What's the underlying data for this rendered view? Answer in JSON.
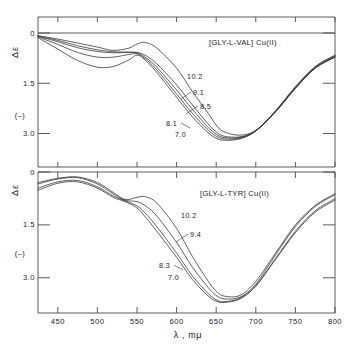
{
  "figure": {
    "xaxis_title": "λ , mμ",
    "x_ticks": [
      "450",
      "500",
      "550",
      "600",
      "650",
      "700",
      "750",
      "800"
    ],
    "x_tick_values": [
      450,
      500,
      550,
      600,
      650,
      700,
      750,
      800
    ],
    "xlim": [
      425,
      800
    ],
    "y_ticks": [
      "0",
      "1.5",
      "3.0"
    ],
    "y_tick_values": [
      0,
      1.5,
      3.0
    ],
    "y_axis_symbol": "Δε",
    "y_negative_marker": "(–)",
    "ylim": [
      0,
      4.0
    ],
    "ink_color": "#2b2b2b",
    "axis_color": "#4a4a4a"
  },
  "panels": [
    {
      "id": "upper",
      "title": "[GLY-L-VAL] Cu(II)",
      "curve_labels": [
        "10.2",
        "9.1",
        "8.5",
        "8.1",
        "7.0"
      ]
    },
    {
      "id": "lower",
      "title": "[GLY-L-TYR] Cu(II)",
      "curve_labels": [
        "10.2",
        "9.4",
        "8.3",
        "7.0"
      ]
    }
  ],
  "chart_data": {
    "type": "line",
    "xlabel": "λ , mμ",
    "ylabel": "Δε (–)",
    "xlim": [
      425,
      800
    ],
    "ylim": [
      0,
      4.0
    ],
    "y_inverted": true,
    "grid": false,
    "legend": "inline curve labels (pH values)",
    "subplots": [
      {
        "name": "[GLY-L-VAL] Cu(II)",
        "legend_title": "pH",
        "series": [
          {
            "name": "10.2",
            "x": [
              425,
              450,
              475,
              500,
              520,
              540,
              550,
              560,
              575,
              600,
              620,
              640,
              650,
              660,
              680,
              700,
              725,
              750,
              775,
              800
            ],
            "y": [
              0.08,
              0.18,
              0.3,
              0.42,
              0.52,
              0.45,
              0.33,
              0.28,
              0.45,
              1.05,
              1.75,
              2.4,
              2.75,
              2.95,
              3.05,
              2.9,
              2.35,
              1.65,
              1.05,
              0.72
            ]
          },
          {
            "name": "9.1",
            "x": [
              425,
              450,
              475,
              500,
              520,
              540,
              550,
              560,
              575,
              600,
              620,
              640,
              650,
              660,
              680,
              700,
              725,
              750,
              775,
              800
            ],
            "y": [
              0.09,
              0.22,
              0.38,
              0.5,
              0.56,
              0.57,
              0.58,
              0.66,
              0.92,
              1.55,
              2.15,
              2.72,
              2.95,
              3.08,
              3.1,
              2.92,
              2.35,
              1.65,
              1.05,
              0.72
            ]
          },
          {
            "name": "8.5",
            "x": [
              425,
              450,
              475,
              500,
              520,
              540,
              550,
              560,
              575,
              600,
              620,
              640,
              650,
              660,
              680,
              700,
              725,
              750,
              775,
              800
            ],
            "y": [
              0.1,
              0.26,
              0.44,
              0.55,
              0.59,
              0.58,
              0.6,
              0.72,
              1.02,
              1.7,
              2.28,
              2.82,
              3.02,
              3.12,
              3.12,
              2.92,
              2.34,
              1.64,
              1.04,
              0.7
            ]
          },
          {
            "name": "8.1",
            "x": [
              425,
              450,
              475,
              500,
              520,
              540,
              550,
              560,
              575,
              600,
              620,
              640,
              650,
              660,
              680,
              700,
              725,
              750,
              775,
              800
            ],
            "y": [
              0.12,
              0.34,
              0.58,
              0.72,
              0.72,
              0.64,
              0.62,
              0.76,
              1.1,
              1.82,
              2.4,
              2.9,
              3.08,
              3.16,
              3.14,
              2.92,
              2.33,
              1.62,
              1.02,
              0.68
            ]
          },
          {
            "name": "7.0",
            "x": [
              425,
              450,
              475,
              500,
              520,
              540,
              550,
              560,
              575,
              600,
              620,
              640,
              650,
              660,
              680,
              700,
              725,
              750,
              775,
              800
            ],
            "y": [
              0.14,
              0.48,
              0.82,
              1.02,
              1.0,
              0.8,
              0.66,
              0.8,
              1.18,
              1.92,
              2.5,
              2.98,
              3.14,
              3.2,
              3.16,
              2.92,
              2.32,
              1.6,
              1.0,
              0.66
            ]
          }
        ]
      },
      {
        "name": "[GLY-L-TYR] Cu(II)",
        "legend_title": "pH",
        "series": [
          {
            "name": "10.2",
            "x": [
              425,
              450,
              475,
              500,
              520,
              535,
              550,
              560,
              575,
              600,
              620,
              640,
              650,
              660,
              680,
              700,
              725,
              750,
              775,
              800
            ],
            "y": [
              0.3,
              0.18,
              0.14,
              0.3,
              0.58,
              0.78,
              0.72,
              0.7,
              0.88,
              1.6,
              2.4,
              3.1,
              3.38,
              3.52,
              3.5,
              3.1,
              2.3,
              1.5,
              0.95,
              0.62
            ]
          },
          {
            "name": "9.4",
            "x": [
              425,
              450,
              475,
              500,
              520,
              535,
              550,
              560,
              575,
              600,
              620,
              640,
              650,
              660,
              680,
              700,
              725,
              750,
              775,
              800
            ],
            "y": [
              0.34,
              0.2,
              0.16,
              0.34,
              0.62,
              0.8,
              0.84,
              0.95,
              1.25,
              2.0,
              2.7,
              3.28,
              3.5,
              3.6,
              3.55,
              3.18,
              2.35,
              1.55,
              0.98,
              0.64
            ]
          },
          {
            "name": "8.3",
            "x": [
              425,
              450,
              475,
              500,
              520,
              535,
              550,
              560,
              575,
              600,
              620,
              640,
              650,
              660,
              680,
              700,
              725,
              750,
              775,
              800
            ],
            "y": [
              0.46,
              0.28,
              0.24,
              0.42,
              0.68,
              0.82,
              0.96,
              1.16,
              1.55,
              2.3,
              2.95,
              3.45,
              3.62,
              3.68,
              3.58,
              3.22,
              2.45,
              1.68,
              1.1,
              0.76
            ]
          },
          {
            "name": "7.0",
            "x": [
              425,
              450,
              475,
              500,
              520,
              535,
              550,
              560,
              575,
              600,
              620,
              640,
              650,
              660,
              680,
              700,
              725,
              750,
              775,
              800
            ],
            "y": [
              0.52,
              0.32,
              0.28,
              0.46,
              0.72,
              0.84,
              1.02,
              1.26,
              1.68,
              2.42,
              3.05,
              3.52,
              3.66,
              3.7,
              3.6,
              3.24,
              2.48,
              1.72,
              1.14,
              0.8
            ]
          }
        ]
      }
    ]
  }
}
